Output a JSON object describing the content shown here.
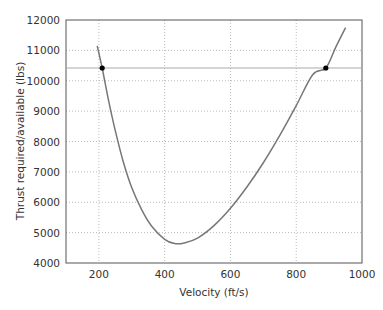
{
  "chart_data": {
    "type": "line",
    "title": "",
    "xlabel": "Velocity (ft/s)",
    "ylabel": "Thrust required/available (lbs)",
    "xlim": [
      100,
      1000
    ],
    "ylim": [
      4000,
      12000
    ],
    "xticks": [
      200,
      400,
      600,
      800,
      1000
    ],
    "yticks": [
      4000,
      5000,
      6000,
      7000,
      8000,
      9000,
      10000,
      11000,
      12000
    ],
    "grid": true,
    "legend": null,
    "series": [
      {
        "name": "Thrust required",
        "color": "#777777",
        "x": [
          195,
          210,
          230,
          250,
          275,
          300,
          330,
          360,
          400,
          430,
          460,
          500,
          550,
          600,
          650,
          700,
          750,
          800,
          850,
          890,
          920,
          950
        ],
        "y": [
          11150,
          10420,
          9320,
          8350,
          7300,
          6480,
          5760,
          5220,
          4780,
          4640,
          4660,
          4820,
          5230,
          5800,
          6500,
          7300,
          8200,
          9180,
          10200,
          10420,
          11100,
          11750
        ]
      },
      {
        "name": "Thrust available",
        "color": "#aaaaaa",
        "x": [
          100,
          1000
        ],
        "y": [
          10420,
          10420
        ]
      }
    ],
    "markers": [
      {
        "x": 210,
        "y": 10420,
        "label": "min speed intersection"
      },
      {
        "x": 890,
        "y": 10420,
        "label": "max speed intersection"
      }
    ]
  }
}
